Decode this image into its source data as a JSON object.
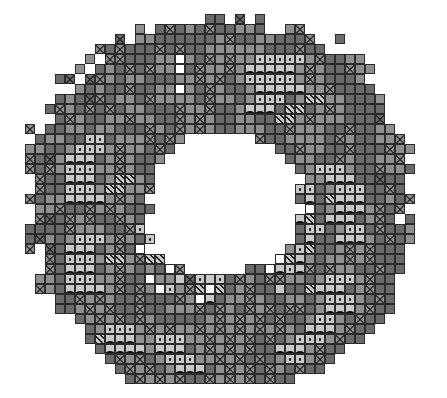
{
  "figure": {
    "width_px": 447,
    "height_px": 398,
    "background_color": "#ffffff"
  },
  "grid": {
    "cell_size_px": 10,
    "origin_x_px": 25,
    "origin_y_px": 14,
    "columns": 39,
    "rows": 37,
    "gridline_color": "#2b2b2b",
    "shape": "annulus"
  },
  "legend": {
    "title": "Cell classes",
    "items": [
      {
        "code": "0",
        "name": "unclassified-background",
        "label": "No data / outside extent",
        "color": "#ffffff",
        "symbol": "none"
      },
      {
        "code": "w",
        "name": "class-white",
        "label": "Class W — white fill",
        "color": "#ffffff",
        "symbol": "plain"
      },
      {
        "code": "1",
        "name": "class-light-gray",
        "label": "Class 1 — light gray",
        "color": "#c9c9c9",
        "symbol": "plain"
      },
      {
        "code": "2",
        "name": "class-medium-gray",
        "label": "Class 2 — medium gray",
        "color": "#8f8f8f",
        "symbol": "plain"
      },
      {
        "code": "3",
        "name": "class-dark-gray",
        "label": "Class 3 — dark gray",
        "color": "#6a6a6a",
        "symbol": "plain"
      },
      {
        "code": "4",
        "name": "class-darkest-gray",
        "label": "Class 4 — darkest gray",
        "color": "#4e4e4e",
        "symbol": "plain"
      },
      {
        "code": "X",
        "name": "class-cross-hatch",
        "label": "Class X — cross-hatched",
        "color": "#8f8f8f",
        "symbol": "x-hatch"
      },
      {
        "code": "Y",
        "name": "class-cross-hatch-dark",
        "label": "Class Y — cross-hatched dark",
        "color": "#6a6a6a",
        "symbol": "x-hatch"
      },
      {
        "code": "S",
        "name": "class-diagonal-stripe",
        "label": "Class S — diagonal stripes",
        "color": "#c9c9c9",
        "symbol": "diagonal-stripe"
      },
      {
        "code": "D",
        "name": "class-dotted",
        "label": "Class D — stippled / dotted",
        "color": "#c9c9c9",
        "symbol": "dot"
      },
      {
        "code": "A",
        "name": "class-arc",
        "label": "Class A — black scallop arc",
        "color": "#c9c9c9",
        "symbol": "arc"
      },
      {
        "code": "B",
        "name": "class-solid-band",
        "label": "Class B — solid black band",
        "color": "#111111",
        "symbol": "solid"
      }
    ]
  },
  "chart_data": {
    "type": "heatmap",
    "xlabel": "column",
    "ylabel": "row",
    "legend_position": "none",
    "grid": true,
    "categories_x": [
      0,
      1,
      2,
      3,
      4,
      5,
      6,
      7,
      8,
      9,
      10,
      11,
      12,
      13,
      14,
      15,
      16,
      17,
      18,
      19,
      20,
      21,
      22,
      23,
      24,
      25,
      26,
      27,
      28,
      29,
      30,
      31,
      32,
      33,
      34,
      35,
      36,
      37,
      38
    ],
    "categories_y": [
      0,
      1,
      2,
      3,
      4,
      5,
      6,
      7,
      8,
      9,
      10,
      11,
      12,
      13,
      14,
      15,
      16,
      17,
      18,
      19,
      20,
      21,
      22,
      23,
      24,
      25,
      26,
      27,
      28,
      29,
      30,
      31,
      32,
      33,
      34,
      35,
      36
    ],
    "value_codes": [
      "0",
      "w",
      "1",
      "2",
      "3",
      "4",
      "X",
      "Y",
      "S",
      "D",
      "A",
      "B"
    ],
    "cells": [
      "0000000000000000003300000000000000000",
      "000000000000000003X33220000000000000",
      "00000000000003333332X3322330000000000",
      "0000000000003X3X33222222333X330000000",
      "000000000033322w23X2X22DDDDD2X3300000",
      "0000000003X3X22w3X22X2AAAAA2X2330000",
      "00000000032233322X2X32DDDDD2X23330000",
      "0000000033X3322w23X2332AAAAA22X33300",
      "000000003223X22223X2232DDD32SS2233300",
      "00000003X322333X22X332AAA3SS32X23330",
      "0000003322X2233X2X2332233SS2X2223330",
      "000000322333X23X2X23322233X22233X330",
      "000003DD3222X3X2X2233X2X3322223X2300",
      "00000DDD2X223X32X0000000033X2233X3300",
      "0000AAA32X23322X000000000032233X2330",
      "0000DDD22X2333X00000000000032DDD2330",
      "0000AAA32SS23X0000000000000022AAA330",
      "0000DDD2SS22X000000000000000032DDD330",
      "0000AAAA2X23300000000000000003SAAA330",
      "000033X2X2333000000000000000032AAA2X30",
      "0003X2X33X23000000000000000003AAA32X30",
      "0003X22233X000000000000000000032DD3X330",
      "00032DDD2X230000000000000000033AAA23X30",
      "0003AAA32X3000000000000000000332X2X3330",
      "0003DDD2SS2X00000000000000000322X2X33300",
      "0003AAA32X23000000000033000003X2233X3300",
      "0003DDD22X33000000003X23000032DDD2X3300",
      "0003AAAA2X3X0000000032X33000SAAA32X3300",
      "00033X2X233X0000000322X2330032DDD23X300",
      "000032X2X33X3000003X23X2X30032AAA2X3300",
      "0000032X2X3X2333332X2X2X3X332DD23X3300",
      "00000032DDD2X2X22X2X2X2X2X23AAA2X33000",
      "0000003SAAA22DDD22X2X2X3X32DDD2X3300",
      "00000003AAAA2AAA32X2X2X33AAA2X33000",
      "000000003X2X32DDD22X2X3X32DD2X3000",
      "0000000003X2X32AAA32X2X3X23X3300",
      "00000000003X2X2X33X2X2X3X330000"
    ],
    "note": "Value codes: 0=no data, w=white class, 1..4=gray tone classes, X/Y=cross-hatch, S=diagonal stripe, D=dotted, A=arc, B=solid band."
  }
}
